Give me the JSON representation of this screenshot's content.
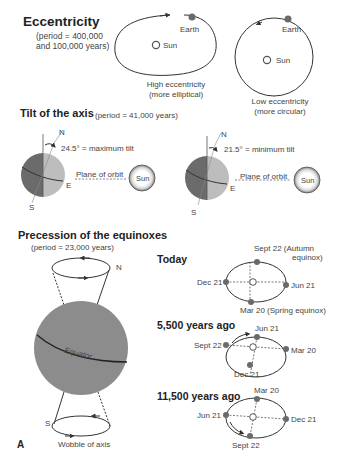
{
  "eccentricity": {
    "title": "Eccentricity",
    "period_line1": "(period = 400,000",
    "period_line2": "and 100,000 years)",
    "high": {
      "earth_label": "Earth",
      "sun_label": "Sun",
      "caption_line1": "High eccentricity",
      "caption_line2": "(more elliptical)"
    },
    "low": {
      "earth_label": "Earth",
      "sun_label": "Sun",
      "caption_line1": "Low eccentricity",
      "caption_line2": "(more circular)"
    }
  },
  "tilt": {
    "title": "Tilt of the axis",
    "period": "(period = 41,000 years)",
    "max": {
      "north_label": "N",
      "south_label": "S",
      "equator_label": "E",
      "angle_label": "24.5° = maximum tilt",
      "orbit_label": "Plane of orbit",
      "sun_label": "Sun"
    },
    "min": {
      "north_label": "N",
      "south_label": "S",
      "equator_label": "E",
      "angle_label": "21.5° = minimum tilt",
      "orbit_label": "Plane of orbit",
      "sun_label": "Sun"
    }
  },
  "precession": {
    "title": "Precession of the equinoxes",
    "period": "(period = 23,000 years)",
    "north_label": "N",
    "south_label": "S",
    "equator_label": "Equator",
    "wobble_label": "Wobble of axis",
    "figure_label": "A",
    "orbits": [
      {
        "heading": "Today",
        "top": "Sept 22 (Autumn",
        "top2": "equinox)",
        "left": "Dec 21",
        "right": "Jun 21",
        "bottom": "Mar 20 (Spring equinox)"
      },
      {
        "heading": "5,500 years ago",
        "top": "Jun 21",
        "left": "Sept 22",
        "right": "Mar 20",
        "bottom": "Dec 21"
      },
      {
        "heading": "11,500 years ago",
        "top": "Mar 20",
        "left": "Jun 21",
        "right": "Dec 21",
        "bottom": "Sept 22"
      }
    ]
  },
  "colors": {
    "dark_gray": "#6b6b6b",
    "light_gray": "#bdbdbd",
    "globe_gray": "#8c8c8c",
    "line": "#333333",
    "dot": "#6a6a6a"
  }
}
